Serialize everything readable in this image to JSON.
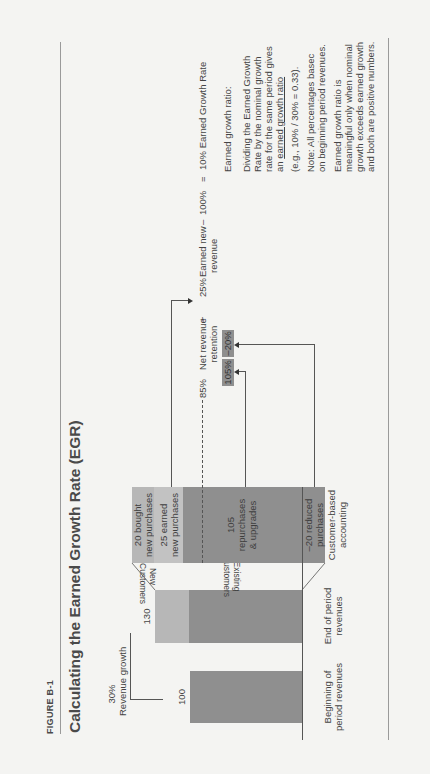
{
  "figure": {
    "label": "FIGURE B-1",
    "title": "Calculating the Earned Growth Rate (EGR)"
  },
  "growth_bracket": {
    "percent": "30%",
    "label": "Revenue growth"
  },
  "bars": {
    "beginning": {
      "value": "100",
      "label_line1": "Beginning of",
      "label_line2": "period revenues"
    },
    "end": {
      "value": "130",
      "label_line1": "End of period",
      "label_line2": "revenues"
    }
  },
  "trapezoid": {
    "new_line1": "New",
    "new_line2": "Customers",
    "existing_line1": "Existing",
    "existing_line2": "Customers"
  },
  "customer_column": {
    "label_line1": "Customer-based",
    "label_line2": "accounting",
    "segments": [
      {
        "line1": "20 bought",
        "line2": "new purchases"
      },
      {
        "line1": "25 earned",
        "line2": "new purchases"
      },
      {
        "line1": "105",
        "line2": "repurchases",
        "line3": "& upgrades"
      },
      {
        "line1": "–20 reduced",
        "line2": "purchases"
      }
    ]
  },
  "boxes": {
    "repurchase": "105%",
    "reduced": "–20%"
  },
  "equation": {
    "nrr_value": "85%",
    "nrr_line1": "Net revenue",
    "nrr_line2": "retention",
    "plus": "+",
    "enr_value": "25%",
    "enr_line1": "Earned new",
    "enr_line2": "revenue",
    "minus": "–",
    "hundred": "100%",
    "equals": "=",
    "result": "10% Earned Growth Rate"
  },
  "notes": {
    "heading": "Earned growth ratio:",
    "p1_line1": "Dividing the Earned Growth",
    "p1_line2": "Rate by the nominal growth",
    "p1_line3": "rate for the same period gives",
    "p1_line4_prefix": "an ",
    "p1_line4_link": "earned growth ratio",
    "example": "(e.g., 10% / 30% = 0.33).",
    "note_line1": "Note: All percentages basec",
    "note_line2": "on beginning period revenues.",
    "p2_line1": "Earned growth ratio is",
    "p2_line2": "meaningful only when nominal",
    "p2_line3": "growth exceeds earned growth",
    "p2_line4": "and both are positive numbers."
  },
  "colors": {
    "dark_bar": "#8f8f8f",
    "light_bar": "#b7b7b7",
    "background": "#f4f4f2"
  }
}
